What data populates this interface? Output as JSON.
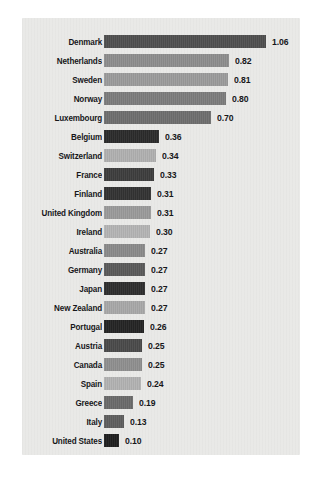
{
  "chart_data": {
    "type": "bar",
    "orientation": "horizontal",
    "title": "",
    "subtitle": "",
    "xlabel": "",
    "ylabel": "",
    "grid": false,
    "legend": null,
    "xlim": [
      0,
      1.06
    ],
    "value_format": "0.00",
    "categories": [
      "Denmark",
      "Netherlands",
      "Sweden",
      "Norway",
      "Luxembourg",
      "Belgium",
      "Switzerland",
      "France",
      "Finland",
      "United Kingdom",
      "Ireland",
      "Australia",
      "Germany",
      "Japan",
      "New Zealand",
      "Portugal",
      "Austria",
      "Canada",
      "Spain",
      "Greece",
      "Italy",
      "United States"
    ],
    "values": [
      1.06,
      0.82,
      0.81,
      0.8,
      0.7,
      0.36,
      0.34,
      0.33,
      0.31,
      0.31,
      0.3,
      0.27,
      0.27,
      0.27,
      0.27,
      0.26,
      0.25,
      0.25,
      0.24,
      0.19,
      0.13,
      0.1
    ],
    "value_labels": [
      "1.06",
      "0.82",
      "0.81",
      "0.80",
      "0.70",
      "0.36",
      "0.34",
      "0.33",
      "0.31",
      "0.31",
      "0.30",
      "0.27",
      "0.27",
      "0.27",
      "0.27",
      "0.26",
      "0.25",
      "0.25",
      "0.24",
      "0.19",
      "0.13",
      "0.10"
    ],
    "bar_colors": [
      "#4f4f4f",
      "#8d8d8d",
      "#9b9b9b",
      "#7c7c7c",
      "#6e6e6e",
      "#2b2b2b",
      "#b0b0b0",
      "#3d3d3d",
      "#333333",
      "#9a9a9a",
      "#b4b4b4",
      "#8a8a8a",
      "#5a5a5a",
      "#2e2e2e",
      "#a8a8a8",
      "#242424",
      "#4a4a4a",
      "#8f8f8f",
      "#b2b2b2",
      "#6a6a6a",
      "#5e5e5e",
      "#1f1f1f"
    ]
  },
  "panel": {
    "background_color": "#e9e9e7"
  },
  "caption": {
    "text": ""
  }
}
